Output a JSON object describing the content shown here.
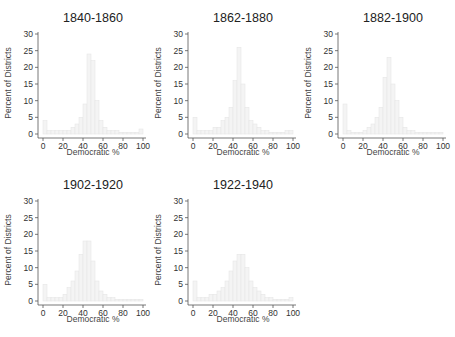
{
  "chart_data": [
    {
      "type": "bar",
      "title": "1840-1860",
      "xlabel": "Democratic %",
      "ylabel": "Percent of Districts",
      "xlim": [
        0,
        100
      ],
      "ylim": [
        0,
        30
      ],
      "xticks": [
        0,
        20,
        40,
        60,
        80,
        100
      ],
      "yticks": [
        0,
        5,
        10,
        15,
        20,
        25,
        30
      ],
      "bin_width": 4,
      "bin_starts": [
        0,
        4,
        8,
        12,
        16,
        20,
        24,
        28,
        32,
        36,
        40,
        44,
        48,
        52,
        56,
        60,
        64,
        68,
        72,
        76,
        80,
        84,
        88,
        92,
        96
      ],
      "values": [
        4,
        1,
        1,
        1,
        1,
        1,
        1,
        2,
        3,
        5,
        9,
        24,
        22,
        10,
        4,
        2,
        1,
        1,
        1,
        0.5,
        0.5,
        0.5,
        0.5,
        0.5,
        1.5
      ]
    },
    {
      "type": "bar",
      "title": "1862-1880",
      "xlabel": "Democratic %",
      "ylabel": "Percent of Districts",
      "xlim": [
        0,
        100
      ],
      "ylim": [
        0,
        30
      ],
      "xticks": [
        0,
        20,
        40,
        60,
        80,
        100
      ],
      "yticks": [
        0,
        5,
        10,
        15,
        20,
        25,
        30
      ],
      "bin_width": 4,
      "bin_starts": [
        0,
        4,
        8,
        12,
        16,
        20,
        24,
        28,
        32,
        36,
        40,
        44,
        48,
        52,
        56,
        60,
        64,
        68,
        72,
        76,
        80,
        84,
        88,
        92,
        96
      ],
      "values": [
        5,
        1,
        1,
        1,
        1,
        2,
        2,
        4,
        5,
        8,
        16,
        26,
        15,
        8,
        4,
        3,
        2,
        1,
        1,
        0.5,
        0.5,
        0.5,
        0.5,
        1,
        1
      ]
    },
    {
      "type": "bar",
      "title": "1882-1900",
      "xlabel": "Democratic %",
      "ylabel": "Percent of Districts",
      "xlim": [
        0,
        100
      ],
      "ylim": [
        0,
        30
      ],
      "xticks": [
        0,
        20,
        40,
        60,
        80,
        100
      ],
      "yticks": [
        0,
        5,
        10,
        15,
        20,
        25,
        30
      ],
      "bin_width": 4,
      "bin_starts": [
        0,
        4,
        8,
        12,
        16,
        20,
        24,
        28,
        32,
        36,
        40,
        44,
        48,
        52,
        56,
        60,
        64,
        68,
        72,
        76,
        80,
        84,
        88,
        92,
        96
      ],
      "values": [
        9,
        1,
        0.5,
        0.5,
        0.5,
        1,
        2,
        3,
        5,
        8,
        17,
        23,
        15,
        10,
        5,
        2,
        1,
        1,
        0.5,
        0.5,
        0.5,
        0.5,
        0.5,
        0.5,
        0.5
      ]
    },
    {
      "type": "bar",
      "title": "1902-1920",
      "xlabel": "Democratic %",
      "ylabel": "Percent of Districts",
      "xlim": [
        0,
        100
      ],
      "ylim": [
        0,
        30
      ],
      "xticks": [
        0,
        20,
        40,
        60,
        80,
        100
      ],
      "yticks": [
        0,
        5,
        10,
        15,
        20,
        25,
        30
      ],
      "bin_width": 4,
      "bin_starts": [
        0,
        4,
        8,
        12,
        16,
        20,
        24,
        28,
        32,
        36,
        40,
        44,
        48,
        52,
        56,
        60,
        64,
        68,
        72,
        76,
        80,
        84,
        88,
        92,
        96
      ],
      "values": [
        5,
        1,
        1,
        1,
        1,
        2,
        4,
        6,
        9,
        14,
        18,
        18,
        12,
        6,
        3,
        2,
        1,
        1,
        0.5,
        0.5,
        0.5,
        0.5,
        0.5,
        0.5,
        0.5
      ]
    },
    {
      "type": "bar",
      "title": "1922-1940",
      "xlabel": "Democratic %",
      "ylabel": "Percent of Districts",
      "xlim": [
        0,
        100
      ],
      "ylim": [
        0,
        30
      ],
      "xticks": [
        0,
        20,
        40,
        60,
        80,
        100
      ],
      "yticks": [
        0,
        5,
        10,
        15,
        20,
        25,
        30
      ],
      "bin_width": 4,
      "bin_starts": [
        0,
        4,
        8,
        12,
        16,
        20,
        24,
        28,
        32,
        36,
        40,
        44,
        48,
        52,
        56,
        60,
        64,
        68,
        72,
        76,
        80,
        84,
        88,
        92,
        96
      ],
      "values": [
        6,
        1,
        1,
        1,
        2,
        2,
        3,
        4,
        6,
        9,
        12,
        14,
        14,
        10,
        6,
        4,
        3,
        2,
        1,
        1,
        0.5,
        0.5,
        0.5,
        0.5,
        1
      ]
    }
  ],
  "panels": [
    {
      "title": "1840-1860",
      "xlabel": "Democratic %",
      "ylabel": "Percent of Districts"
    },
    {
      "title": "1862-1880",
      "xlabel": "Democratic %",
      "ylabel": "Percent of Districts"
    },
    {
      "title": "1882-1900",
      "xlabel": "Democratic %",
      "ylabel": "Percent of Districts"
    },
    {
      "title": "1902-1920",
      "xlabel": "Democratic %",
      "ylabel": "Percent of Districts"
    },
    {
      "title": "1922-1940",
      "xlabel": "Democratic %",
      "ylabel": "Percent of Districts"
    }
  ],
  "colors": {
    "bar_fill": "#f4f4f4",
    "bar_edge": "#e6e6e6",
    "axis": "#555555",
    "text": "#333333"
  }
}
